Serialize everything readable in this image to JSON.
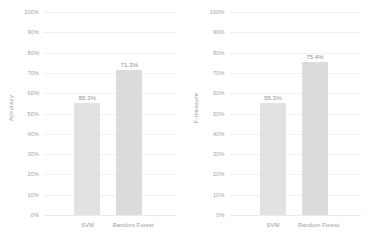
{
  "chart_data": [
    {
      "type": "bar",
      "title": "",
      "xlabel": "",
      "ylabel": "Accuracy",
      "categories": [
        "SVM",
        "Random Forest"
      ],
      "values": [
        55.3,
        71.3
      ],
      "value_labels": [
        "55.3%",
        "71.3%"
      ],
      "ylim": [
        0,
        100
      ],
      "yticks": [
        0,
        10,
        20,
        30,
        40,
        50,
        60,
        70,
        80,
        90,
        100
      ],
      "ytick_labels": [
        "0%",
        "10%",
        "20%",
        "30%",
        "40%",
        "50%",
        "60%",
        "70%",
        "80%",
        "90%",
        "100%"
      ],
      "grid": true,
      "legend": "none",
      "bar_colors": [
        "#e2e2e2",
        "#dcdcdc"
      ]
    },
    {
      "type": "bar",
      "title": "",
      "xlabel": "",
      "ylabel": "F-measure",
      "categories": [
        "SVM",
        "Random Forest"
      ],
      "values": [
        55.3,
        75.4
      ],
      "value_labels": [
        "55.3%",
        "75.4%"
      ],
      "ylim": [
        0,
        100
      ],
      "yticks": [
        0,
        10,
        20,
        30,
        40,
        50,
        60,
        70,
        80,
        90,
        100
      ],
      "ytick_labels": [
        "0%",
        "10%",
        "20%",
        "30%",
        "40%",
        "50%",
        "60%",
        "70%",
        "80%",
        "90%",
        "100%"
      ],
      "grid": true,
      "legend": "none",
      "bar_colors": [
        "#e2e2e2",
        "#dcdcdc"
      ]
    }
  ],
  "panels": [
    {
      "ylabel": "Accuracy",
      "yticks": [
        "100%",
        "90%",
        "80%",
        "70%",
        "60%",
        "50%",
        "40%",
        "30%",
        "20%",
        "10%",
        "0%"
      ],
      "bars": [
        {
          "category": "SVM",
          "value": 55.3,
          "label": "55.3%"
        },
        {
          "category": "Random Forest",
          "value": 71.3,
          "label": "71.3%"
        }
      ]
    },
    {
      "ylabel": "F-measure",
      "yticks": [
        "100%",
        "90%",
        "80%",
        "70%",
        "60%",
        "50%",
        "40%",
        "30%",
        "20%",
        "10%",
        "0%"
      ],
      "bars": [
        {
          "category": "SVM",
          "value": 55.3,
          "label": "55.3%"
        },
        {
          "category": "Random Forest",
          "value": 75.4,
          "label": "75.4%"
        }
      ]
    }
  ],
  "colors": {
    "bar_primary": "#e2e2e2",
    "bar_secondary": "#dcdcdc",
    "gridline": "#f2f2f2",
    "tick_text": "#a3a3a3",
    "label_text": "#8f8f8f",
    "background": "#ffffff"
  }
}
